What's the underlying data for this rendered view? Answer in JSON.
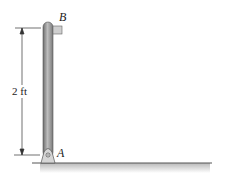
{
  "diagram": {
    "labels": {
      "top": "B",
      "bottom": "A"
    },
    "dimension": {
      "value": "2 ft"
    },
    "colors": {
      "rod": "#8a8a8a",
      "rod_highlight": "#c8c8c8",
      "ground": "#555555",
      "ground_shadow": "#cfcfcf",
      "line": "#333333"
    }
  }
}
